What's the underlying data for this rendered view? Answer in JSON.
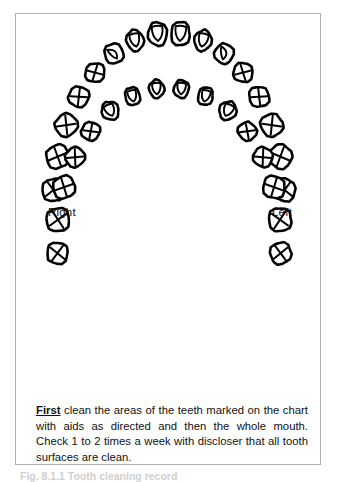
{
  "frame": {
    "present": true,
    "border_color": "#b0b0b0"
  },
  "labels": {
    "right": "Right",
    "left": "Left"
  },
  "instructions": {
    "lead_word": "First",
    "body": " clean the areas of the teeth marked on the chart with aids as directed and then the whole mouth. Check 1 to 2 times a week with discloser that all tooth surfaces are clean.",
    "full_text": "First clean the areas of the teeth marked on the chart with aids as directed and then the whole mouth. Check 1 to 2 times a week with discloser that all tooth surfaces are clean."
  },
  "caption": "Fig. 8.1.1 Tooth cleaning record",
  "colors": {
    "ink": "#000000",
    "frame": "#b0b0b0",
    "caption": "#cfcfcf",
    "page": "#ffffff"
  },
  "chart_data": {
    "type": "diagram",
    "marking_legend": {
      "incisor": "shield-shaped inner outline",
      "canine": "curved cusp line",
      "posterior": "X cross marking"
    },
    "arches": [
      {
        "name": "upper",
        "tooth_count": 16,
        "center_x": 169,
        "center_y": 205,
        "radius_x": 116,
        "radius_y": 172,
        "angle_start": 185,
        "angle_end": 355,
        "teeth": [
          {
            "pos": 1,
            "type": "molar",
            "mark": "cross",
            "w": 23,
            "h": 22
          },
          {
            "pos": 2,
            "type": "molar",
            "mark": "cross",
            "w": 24,
            "h": 23
          },
          {
            "pos": 3,
            "type": "molar",
            "mark": "cross",
            "w": 23,
            "h": 22
          },
          {
            "pos": 4,
            "type": "premolar",
            "mark": "cross",
            "w": 21,
            "h": 20
          },
          {
            "pos": 5,
            "type": "premolar",
            "mark": "cross",
            "w": 20,
            "h": 19
          },
          {
            "pos": 6,
            "type": "canine",
            "mark": "curve",
            "w": 19,
            "h": 20
          },
          {
            "pos": 7,
            "type": "lateral",
            "mark": "shield",
            "w": 17,
            "h": 21
          },
          {
            "pos": 8,
            "type": "central",
            "mark": "shield",
            "w": 19,
            "h": 24
          },
          {
            "pos": 9,
            "type": "central",
            "mark": "shield",
            "w": 19,
            "h": 24
          },
          {
            "pos": 10,
            "type": "lateral",
            "mark": "shield",
            "w": 17,
            "h": 21
          },
          {
            "pos": 11,
            "type": "canine",
            "mark": "curve",
            "w": 19,
            "h": 20
          },
          {
            "pos": 12,
            "type": "premolar",
            "mark": "cross",
            "w": 20,
            "h": 19
          },
          {
            "pos": 13,
            "type": "premolar",
            "mark": "cross",
            "w": 21,
            "h": 20
          },
          {
            "pos": 14,
            "type": "molar",
            "mark": "cross",
            "w": 23,
            "h": 22
          },
          {
            "pos": 15,
            "type": "molar",
            "mark": "cross",
            "w": 24,
            "h": 23
          },
          {
            "pos": 16,
            "type": "molar",
            "mark": "cross",
            "w": 23,
            "h": 22
          }
        ]
      },
      {
        "name": "lower",
        "tooth_count": 16,
        "center_x": 169,
        "center_y": 240,
        "radius_x": 112,
        "radius_y": 152,
        "angle_start": 175,
        "angle_end": 5,
        "teeth": [
          {
            "pos": 1,
            "type": "molar",
            "mark": "cross",
            "w": 22,
            "h": 21
          },
          {
            "pos": 2,
            "type": "molar",
            "mark": "cross",
            "w": 24,
            "h": 23
          },
          {
            "pos": 3,
            "type": "molar",
            "mark": "cross",
            "w": 23,
            "h": 22
          },
          {
            "pos": 4,
            "type": "premolar",
            "mark": "cross",
            "w": 20,
            "h": 19
          },
          {
            "pos": 5,
            "type": "premolar",
            "mark": "cross",
            "w": 19,
            "h": 18
          },
          {
            "pos": 6,
            "type": "canine",
            "mark": "shield",
            "w": 17,
            "h": 19
          },
          {
            "pos": 7,
            "type": "lateral",
            "mark": "shield",
            "w": 15,
            "h": 18
          },
          {
            "pos": 8,
            "type": "central",
            "mark": "shield",
            "w": 15,
            "h": 18
          },
          {
            "pos": 9,
            "type": "central",
            "mark": "shield",
            "w": 15,
            "h": 18
          },
          {
            "pos": 10,
            "type": "lateral",
            "mark": "shield",
            "w": 15,
            "h": 18
          },
          {
            "pos": 11,
            "type": "canine",
            "mark": "shield",
            "w": 17,
            "h": 19
          },
          {
            "pos": 12,
            "type": "premolar",
            "mark": "cross",
            "w": 19,
            "h": 18
          },
          {
            "pos": 13,
            "type": "premolar",
            "mark": "cross",
            "w": 20,
            "h": 19
          },
          {
            "pos": 14,
            "type": "molar",
            "mark": "cross",
            "w": 23,
            "h": 22
          },
          {
            "pos": 15,
            "type": "molar",
            "mark": "cross",
            "w": 24,
            "h": 23
          },
          {
            "pos": 16,
            "type": "molar",
            "mark": "cross",
            "w": 22,
            "h": 21
          }
        ]
      }
    ]
  }
}
